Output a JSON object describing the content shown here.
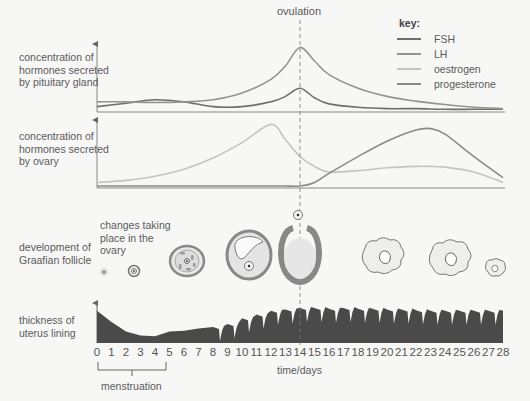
{
  "labels": {
    "pituitary": "concentration of hormones secreted by pituitary gland",
    "ovary": "concentration of hormones secreted by ovary",
    "follicle": "development of Graafian follicle",
    "ovary_changes": "changes taking place in the ovary",
    "uterus": "thickness of uterus lining",
    "ovulation": "ovulation",
    "xlabel": "time/days",
    "menstruation": "menstruation"
  },
  "key": {
    "title": "key:",
    "items": [
      {
        "label": "FSH",
        "color": "#6e6e6e"
      },
      {
        "label": "LH",
        "color": "#939393"
      },
      {
        "label": "oestrogen",
        "color": "#c4c4c4"
      },
      {
        "label": "progesterone",
        "color": "#8a8a8a"
      }
    ]
  },
  "x_ticks": [
    "0",
    "1",
    "2",
    "3",
    "4",
    "5",
    "6",
    "7",
    "8",
    "9",
    "10",
    "11",
    "12",
    "13",
    "14",
    "15",
    "16",
    "17",
    "18",
    "19",
    "20",
    "21",
    "22",
    "23",
    "24",
    "25",
    "26",
    "27",
    "28"
  ],
  "chart_data": [
    {
      "type": "line",
      "title": "concentration of hormones secreted by pituitary gland",
      "xlabel": "time/days",
      "x": [
        0,
        2,
        4,
        6,
        8,
        10,
        12,
        13,
        14,
        15,
        16,
        18,
        20,
        22,
        24,
        26,
        28
      ],
      "series": [
        {
          "name": "FSH",
          "values": [
            0.05,
            0.1,
            0.15,
            0.12,
            0.05,
            0.05,
            0.12,
            0.2,
            0.32,
            0.18,
            0.09,
            0.04,
            0.02,
            0.02,
            0.01,
            0.01,
            0.01
          ]
        },
        {
          "name": "LH",
          "values": [
            0.12,
            0.12,
            0.11,
            0.12,
            0.15,
            0.25,
            0.45,
            0.65,
            0.92,
            0.72,
            0.52,
            0.32,
            0.2,
            0.13,
            0.08,
            0.04,
            0.02
          ]
        }
      ],
      "ylim": [
        0,
        1
      ],
      "annotations": [
        "ovulation at day 14"
      ]
    },
    {
      "type": "line",
      "title": "concentration of hormones secreted by ovary",
      "xlabel": "time/days",
      "x": [
        0,
        2,
        4,
        6,
        8,
        10,
        12,
        13,
        14,
        15,
        16,
        18,
        20,
        22,
        23,
        24,
        26,
        28
      ],
      "series": [
        {
          "name": "oestrogen",
          "values": [
            0.05,
            0.08,
            0.14,
            0.24,
            0.4,
            0.62,
            0.88,
            0.66,
            0.42,
            0.28,
            0.2,
            0.22,
            0.26,
            0.28,
            0.28,
            0.27,
            0.2,
            0.05
          ]
        },
        {
          "name": "progesterone",
          "values": [
            0.0,
            0.0,
            0.0,
            0.0,
            0.0,
            0.0,
            0.0,
            0.0,
            0.0,
            0.05,
            0.18,
            0.42,
            0.64,
            0.8,
            0.82,
            0.74,
            0.42,
            0.12
          ]
        }
      ],
      "ylim": [
        0,
        1
      ]
    },
    {
      "type": "area",
      "title": "thickness of uterus lining",
      "xlabel": "time/days",
      "x": [
        0,
        1,
        2,
        3,
        4,
        5,
        6,
        7,
        8,
        9,
        10,
        11,
        12,
        13,
        14,
        15,
        16,
        17,
        18,
        19,
        20,
        21,
        22,
        23,
        24,
        25,
        26,
        27,
        28
      ],
      "values": [
        0.85,
        0.55,
        0.3,
        0.2,
        0.18,
        0.3,
        0.32,
        0.38,
        0.42,
        0.5,
        0.65,
        0.75,
        0.85,
        0.88,
        0.92,
        0.92,
        0.9,
        0.92,
        0.9,
        0.9,
        0.88,
        0.88,
        0.86,
        0.85,
        0.85,
        0.85,
        0.85,
        0.85,
        0.85
      ],
      "ylim": [
        0,
        1
      ],
      "annotations": [
        "menstruation: days 0-5"
      ]
    }
  ],
  "follicle_stages": [
    {
      "day": 0.5,
      "stage": "primary follicle"
    },
    {
      "day": 2.8,
      "stage": "developing follicle"
    },
    {
      "day": 6.2,
      "stage": "secondary follicle"
    },
    {
      "day": 10.5,
      "stage": "Graafian follicle"
    },
    {
      "day": 14,
      "stage": "ovulation - egg released"
    },
    {
      "day": 18,
      "stage": "corpus luteum"
    },
    {
      "day": 22.7,
      "stage": "corpus luteum"
    },
    {
      "day": 27.4,
      "stage": "degenerating corpus luteum"
    }
  ]
}
